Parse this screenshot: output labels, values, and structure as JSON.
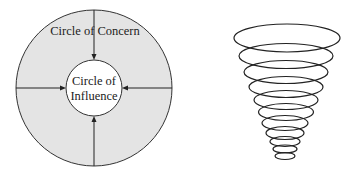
{
  "concern_diagram": {
    "outer_label": "Circle of Concern",
    "inner_label_line1": "Circle of",
    "inner_label_line2": "Influence",
    "outer_fill": "#e4e4e4",
    "inner_fill": "#ffffff",
    "stroke": "#333333"
  },
  "spiral_diagram": {
    "description": "Inverted cone of stacked ellipses (tornado / funnel)",
    "ring_count": 11,
    "stroke": "#222222"
  }
}
